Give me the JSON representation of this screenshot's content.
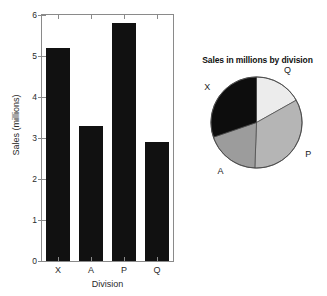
{
  "chart_data": [
    {
      "type": "bar",
      "title": "",
      "xlabel": "Division",
      "ylabel": "Sales (millions)",
      "categories": [
        "X",
        "A",
        "P",
        "Q"
      ],
      "values": [
        5.2,
        3.3,
        5.8,
        2.9
      ],
      "ylim": [
        0,
        6
      ],
      "yticks": [
        0,
        1,
        2,
        3,
        4,
        5,
        6
      ],
      "ytick_labels": [
        "0",
        "1",
        "2",
        "3",
        "4",
        "5",
        "6"
      ],
      "grid": false,
      "legend": "none",
      "bar_color": "#111111",
      "axis_color": "#8a8a8a"
    },
    {
      "type": "pie",
      "title": "Sales in millions by division",
      "labels": [
        "Q",
        "P",
        "A",
        "X"
      ],
      "values": [
        2.9,
        5.8,
        3.3,
        5.2
      ],
      "percentages": [
        16.9,
        33.7,
        19.2,
        30.2
      ],
      "colors": [
        "#ececec",
        "#b5b5b5",
        "#9c9c9c",
        "#0d0d0d"
      ],
      "start_angle_deg": 0,
      "direction": "clockwise",
      "legend": "none",
      "label_positions": [
        "top-right",
        "right",
        "bottom-left",
        "left"
      ]
    }
  ],
  "bar_chart": {
    "y_axis_title": "Sales (millions)",
    "x_axis_title": "Division",
    "y_tick_labels": [
      "6",
      "5",
      "4",
      "3",
      "2",
      "1",
      "0"
    ],
    "bars": [
      {
        "label": "X",
        "value": 5.2
      },
      {
        "label": "A",
        "value": 3.3
      },
      {
        "label": "P",
        "value": 5.8
      },
      {
        "label": "Q",
        "value": 2.9
      }
    ]
  },
  "pie_chart": {
    "title": "Sales in millions by division",
    "slices": [
      {
        "label": "Q",
        "value": 2.9,
        "color": "#ececec"
      },
      {
        "label": "P",
        "value": 5.8,
        "color": "#b5b5b5"
      },
      {
        "label": "A",
        "value": 3.3,
        "color": "#9c9c9c"
      },
      {
        "label": "X",
        "value": 5.2,
        "color": "#0d0d0d"
      }
    ]
  }
}
